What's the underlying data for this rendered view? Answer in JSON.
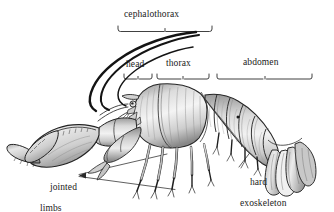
{
  "figure": {
    "kind": "anatomical-illustration",
    "background_color": "#ffffff",
    "ink_color": "#1a1a1a",
    "width": 334,
    "height": 211
  },
  "labels": {
    "cephalothorax": "cephalothorax",
    "head": "head",
    "thorax": "thorax",
    "abdomen": "abdomen",
    "jointed_limbs_line1": "jointed",
    "jointed_limbs_line2": "limbs",
    "hard_exoskeleton_line1": "hard",
    "hard_exoskeleton_line2": "exoskeleton"
  },
  "brackets": [
    {
      "name": "cephalothorax-bracket",
      "x1": 117,
      "x2": 213,
      "y": 31,
      "tick": 5
    },
    {
      "name": "head-bracket",
      "x1": 124,
      "x2": 152,
      "y": 79,
      "tick": 5
    },
    {
      "name": "thorax-bracket",
      "x1": 156,
      "x2": 209,
      "y": 79,
      "tick": 5
    },
    {
      "name": "abdomen-bracket",
      "x1": 216,
      "x2": 313,
      "y": 79,
      "tick": 5
    }
  ],
  "leaders": [
    {
      "name": "jointed-limbs-leader-upper",
      "from": [
        78,
        174
      ],
      "to": [
        166,
        155
      ]
    },
    {
      "name": "jointed-limbs-leader-lower",
      "from": [
        78,
        176
      ],
      "to": [
        172,
        188
      ]
    },
    {
      "name": "hard-exoskeleton-leader",
      "from": [
        238,
        168
      ],
      "to": [
        266,
        131
      ]
    }
  ],
  "anatomy_parts": [
    "antennae",
    "antennules",
    "rostrum",
    "eye",
    "carapace",
    "cheliped-claw",
    "walking-legs",
    "abdominal-segments",
    "swimmerets",
    "uropods",
    "telson"
  ]
}
